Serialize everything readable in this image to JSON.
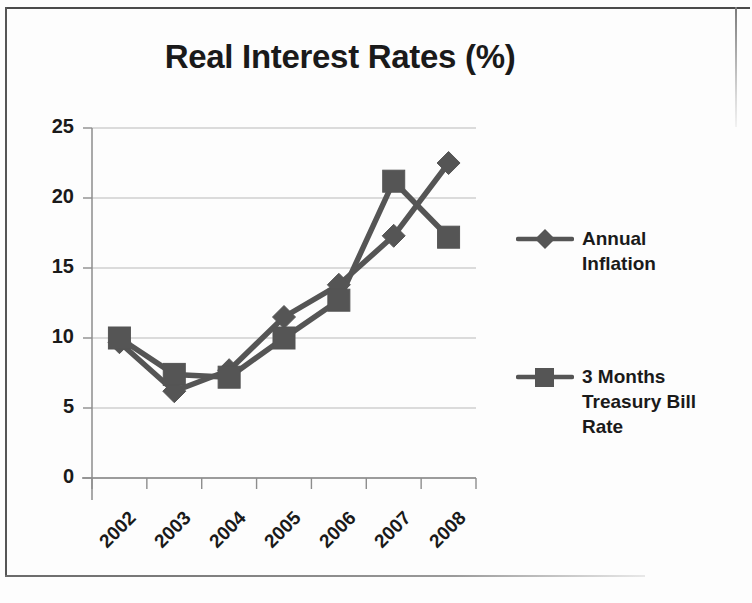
{
  "chart_data": {
    "type": "line",
    "title": "Real Interest Rates (%)",
    "xlabel": "",
    "ylabel": "",
    "categories": [
      "2002",
      "2003",
      "2004",
      "2005",
      "2006",
      "2007",
      "2008"
    ],
    "series": [
      {
        "name": "Annual Inflation",
        "marker": "diamond",
        "color": "#555555",
        "values": [
          9.7,
          6.2,
          7.7,
          11.5,
          13.8,
          17.3,
          22.5
        ]
      },
      {
        "name": "3 Months Treasury Bill Rate",
        "marker": "square",
        "color": "#555555",
        "values": [
          10.0,
          7.4,
          7.2,
          10.0,
          12.7,
          21.2,
          17.2
        ]
      }
    ],
    "ylim": [
      0,
      25
    ],
    "yticks": [
      0,
      5,
      10,
      15,
      20,
      25
    ],
    "ytick_labels": [
      "0",
      "5",
      "10",
      "15",
      "20",
      "25"
    ],
    "grid": "horizontal",
    "legend_position": "right",
    "xtick_rotation": -45
  },
  "legend": {
    "entries": [
      {
        "label": "Annual\nInflation",
        "marker": "diamond-marker"
      },
      {
        "label": "3 Months\nTreasury Bill\nRate",
        "marker": "square-marker"
      }
    ]
  },
  "colors": {
    "series_line": "#555555",
    "grid": "#b9b9b9",
    "axis": "#8d8d8d",
    "text": "#1a1a1a",
    "page_background": "#fdfdfd",
    "border": "#4a4a4a"
  }
}
